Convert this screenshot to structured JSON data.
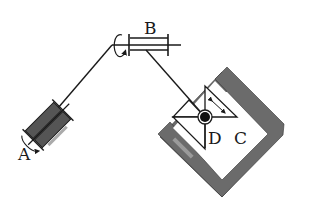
{
  "diagram": {
    "type": "mechanism-schematic",
    "labels": {
      "A": "A",
      "B": "B",
      "C": "C",
      "D": "D"
    },
    "components": [
      {
        "id": "A",
        "description": "bearing / rotating joint at lower-left end of shaft"
      },
      {
        "id": "B",
        "description": "horizontal shaft bearing with rotation arrow"
      },
      {
        "id": "C",
        "description": "L-shaped channel guide (hatched gray)"
      },
      {
        "id": "D",
        "description": "ball joint / slider sitting inside channel C"
      }
    ],
    "colors": {
      "line": "#1a1a1a",
      "fill_dark": "#555555",
      "fill_gray": "#6e6e6e",
      "background": "#ffffff"
    }
  }
}
